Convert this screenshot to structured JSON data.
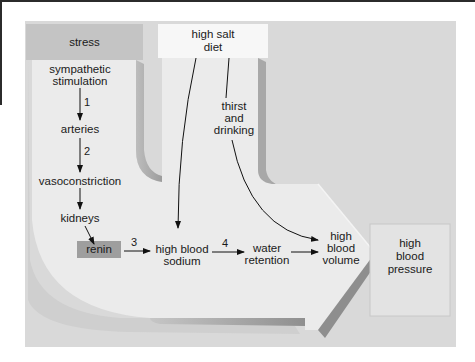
{
  "diagram": {
    "type": "flowchart",
    "colors": {
      "panel_background": "#d9d9d9",
      "arrow_fill": "#ebebeb",
      "arrow_shadow": "#a9a9a9",
      "stress_box": "#c4c4c4",
      "salt_box": "#f7f7f7",
      "renin_box": "#9e9e9e",
      "pressure_box": "#e3e3e3",
      "line": "#111111"
    },
    "boxes": {
      "stress": "stress",
      "high_salt_diet_1": "high salt",
      "high_salt_diet_2": "diet",
      "renin": "renin",
      "high_blood_pressure_1": "high",
      "high_blood_pressure_2": "blood",
      "high_blood_pressure_3": "pressure"
    },
    "nodes": {
      "sympathetic_1": "sympathetic",
      "sympathetic_2": "stimulation",
      "arteries": "arteries",
      "vasoconstriction": "vasoconstriction",
      "kidneys": "kidneys",
      "sodium_1": "high blood",
      "sodium_2": "sodium",
      "water_1": "water",
      "water_2": "retention",
      "volume_1": "high",
      "volume_2": "blood",
      "volume_3": "volume",
      "thirst_1": "thirst",
      "thirst_2": "and",
      "thirst_3": "drinking"
    },
    "step_numbers": {
      "s1": "1",
      "s2": "2",
      "s3": "3",
      "s4": "4"
    },
    "edges": [
      {
        "from": "sympathetic stimulation",
        "to": "arteries",
        "label": "1"
      },
      {
        "from": "arteries",
        "to": "vasoconstriction",
        "label": "2"
      },
      {
        "from": "vasoconstriction",
        "to": "kidneys",
        "label": ""
      },
      {
        "from": "kidneys",
        "to": "renin",
        "label": ""
      },
      {
        "from": "renin",
        "to": "high blood sodium",
        "label": "3"
      },
      {
        "from": "high blood sodium",
        "to": "water retention",
        "label": "4"
      },
      {
        "from": "water retention",
        "to": "high blood volume",
        "label": ""
      },
      {
        "from": "high salt diet",
        "to": "high blood sodium",
        "label": ""
      },
      {
        "from": "high salt diet",
        "to": "thirst and drinking",
        "label": ""
      },
      {
        "from": "thirst and drinking",
        "to": "high blood volume",
        "label": ""
      },
      {
        "from": "high blood volume",
        "to": "high blood pressure",
        "label": "(large arrow)"
      }
    ]
  }
}
